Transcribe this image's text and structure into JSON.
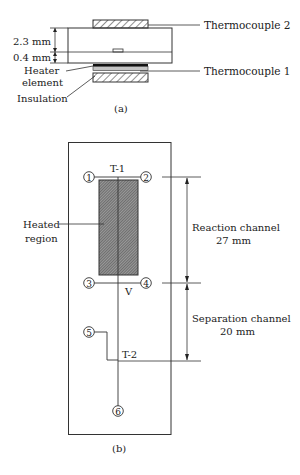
{
  "figure_a": {
    "caption": "(a)",
    "labels": {
      "thermocouple_2": "Thermocouple 2",
      "thermocouple_1": "Thermocouple 1",
      "heater_line1": "Heater",
      "heater_line2": "element",
      "insulation": "Insulation"
    },
    "dimensions": {
      "top_layer": "2.3 mm",
      "bottom_layer": "0.4 mm"
    }
  },
  "figure_b": {
    "caption": "(b)",
    "labels": {
      "heated_line1": "Heated",
      "heated_line2": "region",
      "t1": "T-1",
      "t2": "T-2",
      "v": "V",
      "reaction_line1": "Reaction channel",
      "reaction_line2": "27 mm",
      "separation_line1": "Separation channel",
      "separation_line2": "20 mm"
    },
    "ports": [
      "1",
      "2",
      "3",
      "4",
      "5",
      "6"
    ]
  },
  "colors": {
    "line": "#333333",
    "hatch": "#555555",
    "heater": "#111111",
    "layer_gray": "#bbbbbb"
  }
}
